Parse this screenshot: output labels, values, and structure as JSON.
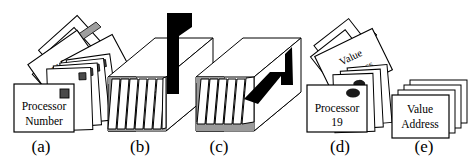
{
  "figure": {
    "background": "#ffffff",
    "ink": "#000000",
    "gray_face": "#9a9a9a",
    "light_gray": "#c8c8c8",
    "width": 472,
    "height": 162
  },
  "panels": [
    {
      "id": "a",
      "caption": "(a)",
      "caption_x": 112,
      "caption_y": 152,
      "kind": "fanned-card-stack",
      "card_labels": [
        "Value",
        "ress"
      ],
      "front_card_line1": "Processor",
      "front_card_line2": "Number",
      "has_corner_marker": true
    },
    {
      "id": "b",
      "caption": "(b)",
      "caption_x": 140,
      "caption_y": 152,
      "kind": "open-box-with-cards",
      "black_shape": "flag-bar",
      "card_count": 6
    },
    {
      "id": "c",
      "caption": "(c)",
      "caption_x": 219,
      "caption_y": 152,
      "kind": "open-box-with-cards",
      "black_shape": "bent-arrow",
      "card_count": 5
    },
    {
      "id": "d",
      "caption": "(d)",
      "caption_x": 340,
      "caption_y": 152,
      "kind": "fanned-card-stack",
      "card_labels": [
        "Value",
        "Address"
      ],
      "front_card_line1": "Processor",
      "front_card_line2": "19",
      "has_corner_marker": true
    },
    {
      "id": "e",
      "caption": "(e)",
      "caption_x": 424,
      "caption_y": 152,
      "kind": "offset-card-stack",
      "front_card_line1": "Value",
      "front_card_line2": "Address",
      "card_count": 4
    }
  ],
  "captions": {
    "a": "(a)",
    "b": "(b)",
    "c": "(c)",
    "d": "(d)",
    "e": "(e)"
  },
  "labels": {
    "a_value": "Value",
    "a_address": "ress",
    "a_front_1": "Processor",
    "a_front_2": "Number",
    "d_value": "Value",
    "d_address": "Address",
    "d_front_1": "Processor",
    "d_front_2": "19",
    "e_front_1": "Value",
    "e_front_2": "Address"
  }
}
